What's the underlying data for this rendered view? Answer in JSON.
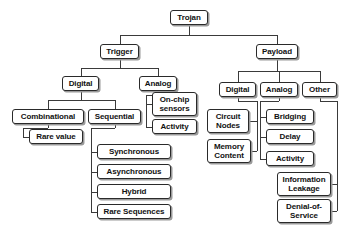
{
  "diagram": {
    "type": "hierarchy-tree",
    "style": {
      "box_fill": "#ffffff",
      "box_border": "#2a2a2a",
      "box_shadow": "#9a9a9a",
      "edge_color": "#3a3a3a",
      "text_color": "#111111",
      "background": "#ffffff"
    },
    "nodes": [
      {
        "id": "trojan",
        "label": "Trojan",
        "x": 170,
        "y": 10,
        "w": 38,
        "h": 15
      },
      {
        "id": "trigger",
        "label": "Trigger",
        "x": 100,
        "y": 44,
        "w": 39,
        "h": 15
      },
      {
        "id": "payload",
        "label": "Payload",
        "x": 256,
        "y": 44,
        "w": 42,
        "h": 15
      },
      {
        "id": "trig-digital",
        "label": "Digital",
        "x": 62,
        "y": 76,
        "w": 37,
        "h": 15
      },
      {
        "id": "trig-analog",
        "label": "Analog",
        "x": 139,
        "y": 76,
        "w": 38,
        "h": 15
      },
      {
        "id": "pay-digital",
        "label": "Digital",
        "x": 219,
        "y": 82,
        "w": 37,
        "h": 15
      },
      {
        "id": "pay-analog",
        "label": "Analog",
        "x": 260,
        "y": 82,
        "w": 38,
        "h": 15
      },
      {
        "id": "pay-other",
        "label": "Other",
        "x": 302,
        "y": 82,
        "w": 35,
        "h": 15
      },
      {
        "id": "onchip",
        "label": "On-chip\nsensors",
        "x": 152,
        "y": 92,
        "w": 45,
        "h": 24
      },
      {
        "id": "trig-activity",
        "label": "Activity",
        "x": 152,
        "y": 119,
        "w": 45,
        "h": 15
      },
      {
        "id": "combinational",
        "label": "Combinational",
        "x": 12,
        "y": 109,
        "w": 72,
        "h": 15
      },
      {
        "id": "sequential",
        "label": "Sequential",
        "x": 88,
        "y": 109,
        "w": 53,
        "h": 15
      },
      {
        "id": "rare-value",
        "label": "Rare value",
        "x": 29,
        "y": 129,
        "w": 54,
        "h": 15
      },
      {
        "id": "synchronous",
        "label": "Synchronous",
        "x": 97,
        "y": 144,
        "w": 74,
        "h": 15
      },
      {
        "id": "asynchronous",
        "label": "Asynchronous",
        "x": 97,
        "y": 164,
        "w": 74,
        "h": 15
      },
      {
        "id": "hybrid",
        "label": "Hybrid",
        "x": 97,
        "y": 184,
        "w": 74,
        "h": 15
      },
      {
        "id": "rare-sequences",
        "label": "Rare Sequences",
        "x": 97,
        "y": 204,
        "w": 74,
        "h": 15
      },
      {
        "id": "circuit-nodes",
        "label": "Circuit\nNodes",
        "x": 207,
        "y": 109,
        "w": 42,
        "h": 24
      },
      {
        "id": "memory-content",
        "label": "Memory\nContent",
        "x": 207,
        "y": 139,
        "w": 44,
        "h": 24
      },
      {
        "id": "bridging",
        "label": "Bridging",
        "x": 266,
        "y": 109,
        "w": 48,
        "h": 15
      },
      {
        "id": "delay",
        "label": "Delay",
        "x": 266,
        "y": 129,
        "w": 48,
        "h": 15
      },
      {
        "id": "pay-activity",
        "label": "Activity",
        "x": 266,
        "y": 151,
        "w": 48,
        "h": 15
      },
      {
        "id": "info-leakage",
        "label": "Information\nLeakage",
        "x": 277,
        "y": 172,
        "w": 54,
        "h": 24
      },
      {
        "id": "denial-service",
        "label": "Denial-of-\nService",
        "x": 277,
        "y": 199,
        "w": 54,
        "h": 24
      }
    ],
    "edges": [
      {
        "from": "trojan",
        "to": "trigger",
        "kind": "tree-down"
      },
      {
        "from": "trojan",
        "to": "payload",
        "kind": "tree-down"
      },
      {
        "from": "trigger",
        "to": "trig-digital",
        "kind": "tree-down"
      },
      {
        "from": "trigger",
        "to": "trig-analog",
        "kind": "tree-down"
      },
      {
        "from": "payload",
        "to": "pay-digital",
        "kind": "tree-down"
      },
      {
        "from": "payload",
        "to": "pay-analog",
        "kind": "tree-down"
      },
      {
        "from": "payload",
        "to": "pay-other",
        "kind": "tree-down"
      },
      {
        "from": "trig-digital",
        "to": "combinational",
        "kind": "tree-down"
      },
      {
        "from": "trig-digital",
        "to": "sequential",
        "kind": "tree-down"
      },
      {
        "from": "trig-analog",
        "to": "onchip",
        "kind": "elbow-left"
      },
      {
        "from": "trig-analog",
        "to": "trig-activity",
        "kind": "elbow-left"
      },
      {
        "from": "combinational",
        "to": "rare-value",
        "kind": "elbow-left"
      },
      {
        "from": "sequential",
        "to": "synchronous",
        "kind": "elbow-left"
      },
      {
        "from": "sequential",
        "to": "asynchronous",
        "kind": "elbow-left"
      },
      {
        "from": "sequential",
        "to": "hybrid",
        "kind": "elbow-left"
      },
      {
        "from": "sequential",
        "to": "rare-sequences",
        "kind": "elbow-left"
      },
      {
        "from": "pay-digital",
        "to": "circuit-nodes",
        "kind": "elbow-right"
      },
      {
        "from": "pay-digital",
        "to": "memory-content",
        "kind": "elbow-right"
      },
      {
        "from": "pay-analog",
        "to": "bridging",
        "kind": "elbow-left"
      },
      {
        "from": "pay-analog",
        "to": "delay",
        "kind": "elbow-left"
      },
      {
        "from": "pay-analog",
        "to": "pay-activity",
        "kind": "elbow-left"
      },
      {
        "from": "pay-other",
        "to": "info-leakage",
        "kind": "elbow-right"
      },
      {
        "from": "pay-other",
        "to": "denial-service",
        "kind": "elbow-right"
      }
    ]
  }
}
